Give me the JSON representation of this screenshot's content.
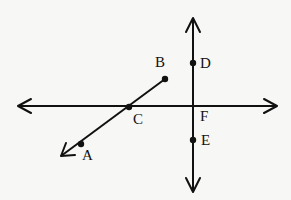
{
  "diagram": {
    "type": "geometry",
    "lines": [
      {
        "name": "horizontal-line",
        "through": [
          "C",
          "F"
        ],
        "kind": "line"
      },
      {
        "name": "vertical-line",
        "through": [
          "D",
          "F",
          "E"
        ],
        "kind": "line"
      },
      {
        "name": "ray-BA",
        "from": "B",
        "through": [
          "C",
          "A"
        ],
        "kind": "ray"
      }
    ],
    "points": [
      {
        "id": "A",
        "label": "A"
      },
      {
        "id": "B",
        "label": "B"
      },
      {
        "id": "C",
        "label": "C"
      },
      {
        "id": "D",
        "label": "D"
      },
      {
        "id": "E",
        "label": "E"
      },
      {
        "id": "F",
        "label": "F"
      }
    ]
  }
}
